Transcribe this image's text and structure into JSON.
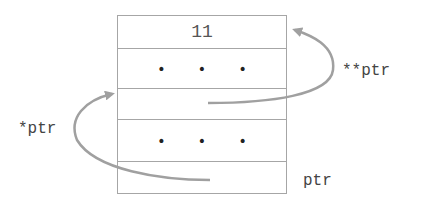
{
  "diagram": {
    "type": "pointer-to-pointer memory diagram",
    "cells": [
      {
        "content": "11",
        "kind": "value"
      },
      {
        "content": "• • •",
        "kind": "ellipsis"
      },
      {
        "content": "",
        "kind": "pointer-cell"
      },
      {
        "content": "• • •",
        "kind": "ellipsis"
      },
      {
        "content": "",
        "kind": "pointer-cell"
      }
    ],
    "labels": {
      "double_pointer": "**ptr",
      "single_pointer": "*ptr",
      "ptr": "ptr"
    },
    "arrows": [
      {
        "from": "cell 3",
        "to": "cell 1",
        "label": "**ptr",
        "side": "right"
      },
      {
        "from": "cell 5",
        "to": "cell 3",
        "label": "*ptr",
        "side": "left"
      }
    ],
    "colors": {
      "border": "#a6a6a6",
      "arrow": "#a0a0a0",
      "text": "#444444"
    }
  }
}
